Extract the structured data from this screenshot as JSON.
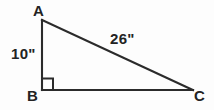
{
  "figure": {
    "background_color": "#fdfdfd",
    "stroke_color": "#2b2b2b",
    "label_color": "#232323",
    "vertices": [
      {
        "name": "A",
        "label": "A",
        "x": 42,
        "y": 20
      },
      {
        "name": "B",
        "label": "B",
        "x": 42,
        "y": 90
      },
      {
        "name": "C",
        "label": "C",
        "x": 193,
        "y": 90
      }
    ],
    "sides": [
      {
        "name": "AB",
        "label": "10\"",
        "from": "A",
        "to": "B",
        "measure": 10,
        "unit": "inches"
      },
      {
        "name": "AC",
        "label": "26\"",
        "from": "A",
        "to": "C",
        "measure": 26,
        "unit": "inches"
      },
      {
        "name": "BC",
        "label": "",
        "from": "B",
        "to": "C",
        "measure": null,
        "unit": "inches"
      }
    ],
    "right_angle": {
      "at_vertex": "B",
      "marker": "square",
      "size": 11
    }
  }
}
